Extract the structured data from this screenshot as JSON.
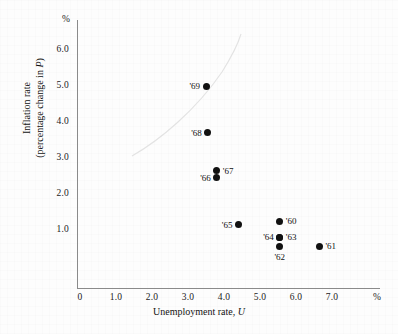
{
  "chart_data": {
    "type": "scatter",
    "title": "",
    "xlabel": "Unemployment rate, U",
    "ylabel": "Inflation rate (percentage change in P)",
    "ylabel_line1": "Inflation rate",
    "ylabel_line2": "(percentage change in P)",
    "ylabel_line2_prefix": "(percentage change in ",
    "ylabel_line2_italic": "P",
    "ylabel_line2_suffix": ")",
    "xlabel_prefix": "Unemployment rate, ",
    "xlabel_italic": "U",
    "x_unit": "%",
    "y_unit": "%",
    "xlim": [
      0,
      7.6
    ],
    "ylim": [
      0,
      6.8
    ],
    "grid": false,
    "legend": false,
    "x_ticks": [
      "0",
      "1.0",
      "2.0",
      "3.0",
      "4.0",
      "5.0",
      "6.0",
      "7.0"
    ],
    "x_tick_values": [
      0,
      1.0,
      2.0,
      3.0,
      4.0,
      5.0,
      6.0,
      7.0
    ],
    "y_ticks": [
      "1.0",
      "2.0",
      "3.0",
      "4.0",
      "5.0",
      "6.0"
    ],
    "y_tick_values": [
      1.0,
      2.0,
      3.0,
      4.0,
      5.0,
      6.0
    ],
    "point_color": "#111111",
    "axis_color": "#8a8a8a",
    "points": [
      {
        "label": "'60",
        "x": 5.55,
        "y": 1.75,
        "label_side": "right"
      },
      {
        "label": "'61",
        "x": 6.65,
        "y": 1.05,
        "label_side": "right"
      },
      {
        "label": "'62",
        "x": 5.55,
        "y": 1.05,
        "label_side": "bottom"
      },
      {
        "label": "'63",
        "x": 5.55,
        "y": 1.3,
        "label_side": "right"
      },
      {
        "label": "'64",
        "x": 5.55,
        "y": 1.3,
        "label_side": "left"
      },
      {
        "label": "'65",
        "x": 4.4,
        "y": 1.65,
        "label_side": "left"
      },
      {
        "label": "'66",
        "x": 3.8,
        "y": 2.95,
        "label_side": "left"
      },
      {
        "label": "'67",
        "x": 3.8,
        "y": 3.15,
        "label_side": "right"
      },
      {
        "label": "'68",
        "x": 3.55,
        "y": 4.2,
        "label_side": "left"
      },
      {
        "label": "'69",
        "x": 3.5,
        "y": 5.5,
        "label_side": "left"
      }
    ]
  }
}
